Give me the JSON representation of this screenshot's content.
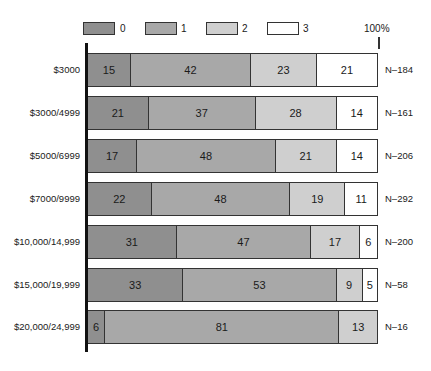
{
  "chart_data": {
    "type": "bar",
    "orientation": "horizontal",
    "stacked": true,
    "percent_stacked": true,
    "title": "",
    "xlabel": "",
    "ylabel": "",
    "axis_label_100": "100%",
    "xlim": [
      0,
      100
    ],
    "grid": false,
    "legend_position": "top",
    "categories": [
      "$3000",
      "$3000/4999",
      "$5000/6999",
      "$7000/9999",
      "$10,000/14,999",
      "$15,000/19,999",
      "$20,000/24,999"
    ],
    "n_labels": [
      "N=184",
      "N=161",
      "N=206",
      "N=292",
      "N=200",
      "N=58",
      "N=16"
    ],
    "series": [
      {
        "name": "0",
        "color": "#8f8f8f",
        "values": [
          15,
          21,
          17,
          22,
          31,
          33,
          6
        ]
      },
      {
        "name": "1",
        "color": "#a8a8a8",
        "values": [
          42,
          37,
          48,
          48,
          47,
          53,
          81
        ]
      },
      {
        "name": "2",
        "color": "#cfcfcf",
        "values": [
          23,
          28,
          21,
          19,
          17,
          9,
          13
        ]
      },
      {
        "name": "3",
        "color": "#ffffff",
        "values": [
          21,
          14,
          14,
          11,
          6,
          5,
          0
        ]
      }
    ]
  },
  "legend": [
    {
      "label": "0",
      "color": "#8f8f8f"
    },
    {
      "label": "1",
      "color": "#a8a8a8"
    },
    {
      "label": "2",
      "color": "#cfcfcf"
    },
    {
      "label": "3",
      "color": "#ffffff"
    }
  ],
  "pct_label": "100%",
  "rows": [
    {
      "label": "$3000",
      "n": "N–184",
      "values": [
        "15",
        "42",
        "23",
        "21"
      ]
    },
    {
      "label": "$3000/4999",
      "n": "N–161",
      "values": [
        "21",
        "37",
        "28",
        "14"
      ]
    },
    {
      "label": "$5000/6999",
      "n": "N–206",
      "values": [
        "17",
        "48",
        "21",
        "14"
      ]
    },
    {
      "label": "$7000/9999",
      "n": "N–292",
      "values": [
        "22",
        "48",
        "19",
        "11"
      ]
    },
    {
      "label": "$10,000/14,999",
      "n": "N–200",
      "values": [
        "31",
        "47",
        "17",
        "6"
      ]
    },
    {
      "label": "$15,000/19,999",
      "n": "N–58",
      "values": [
        "33",
        "53",
        "9",
        "5"
      ]
    },
    {
      "label": "$20,000/24,999",
      "n": "N–16",
      "values": [
        "6",
        "81",
        "13",
        ""
      ]
    }
  ]
}
